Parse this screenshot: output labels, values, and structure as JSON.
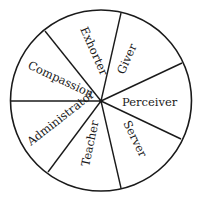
{
  "diagram": {
    "type": "segmented-circle",
    "colors": {
      "stroke": "#1a1a1a",
      "fill": "#ffffff",
      "text": "#1a1a1a"
    },
    "segments": [
      {
        "label": "Exhorter"
      },
      {
        "label": "Giver"
      },
      {
        "label": "Perceiver"
      },
      {
        "label": "Server"
      },
      {
        "label": "Teacher"
      },
      {
        "label": "Administrator"
      },
      {
        "label": "Compassion"
      }
    ]
  }
}
